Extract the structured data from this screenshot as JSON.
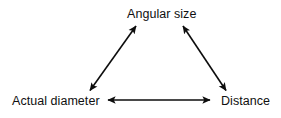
{
  "diagram": {
    "background_color": "#ffffff",
    "stroke_color": "#0d0d0d",
    "text_color": "#101010",
    "nodes": [
      {
        "id": "angular-size",
        "label": "Angular size",
        "position": "top-center"
      },
      {
        "id": "actual-diameter",
        "label": "Actual diameter",
        "position": "bottom-left"
      },
      {
        "id": "distance",
        "label": "Distance",
        "position": "bottom-right"
      }
    ],
    "connectors": [
      {
        "id": "actual-diameter-to-angular-size",
        "from": "actual-diameter",
        "to": "angular-size",
        "style": "double-headed-arrow",
        "orientation": "diagonal-up-right"
      },
      {
        "id": "angular-size-to-distance",
        "from": "angular-size",
        "to": "distance",
        "style": "double-headed-arrow",
        "orientation": "diagonal-down-right"
      },
      {
        "id": "actual-diameter-to-distance",
        "from": "actual-diameter",
        "to": "distance",
        "style": "double-headed-arrow",
        "orientation": "horizontal"
      }
    ]
  }
}
